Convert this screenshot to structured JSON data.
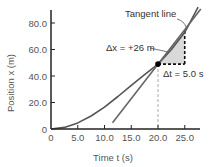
{
  "chart_data": {
    "type": "line",
    "title": "",
    "xlabel": "Time  t  (s)",
    "ylabel": "Position  x  (m)",
    "xlim": [
      0,
      28
    ],
    "ylim": [
      0,
      92
    ],
    "x_ticks": [
      0,
      5.0,
      10.0,
      15.0,
      20.0,
      25.0
    ],
    "x_tick_labels": [
      "0",
      "5.0",
      "10.0",
      "15.0",
      "20.0",
      "25.0"
    ],
    "y_ticks": [
      0,
      20.0,
      40.0,
      60.0,
      80.0
    ],
    "y_tick_labels": [
      "0",
      "20.0",
      "40.0",
      "60.0",
      "80.0"
    ],
    "grid": false,
    "series": [
      {
        "name": "Position curve",
        "x": [
          0,
          2.5,
          5,
          7.5,
          10,
          12.5,
          15,
          17.5,
          20,
          22.5,
          25,
          27.5
        ],
        "values": [
          0,
          1.2,
          4.6,
          9.8,
          16.5,
          24.5,
          33,
          41,
          49,
          60,
          73,
          92
        ]
      },
      {
        "name": "Tangent line",
        "x": [
          11.5,
          28
        ],
        "values": [
          4.8,
          90.6
        ]
      }
    ],
    "point": {
      "t": 20.0,
      "x": 49
    },
    "annotations": {
      "tangent_label": "Tangent line",
      "delta_x_label": "Δx = +26 m",
      "delta_t_label": "Δt = 5.0 s"
    },
    "colors": {
      "curve": "#555555",
      "tangent": "#666666",
      "axes": "#222222",
      "shade": "#d9d9d9",
      "dashed": "#111111",
      "guide": "#aaaaaa"
    }
  }
}
